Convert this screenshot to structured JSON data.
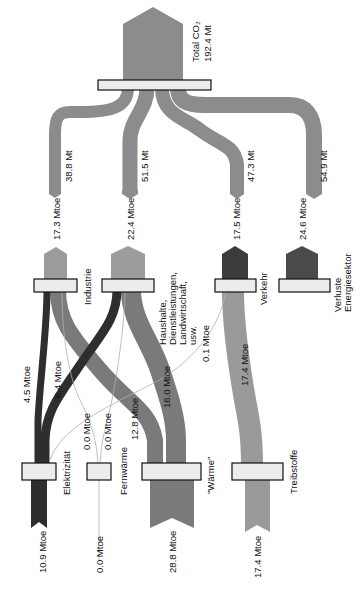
{
  "colors": {
    "co2_flow": "#8c8c8c",
    "sector_flow_light": "#9c9c9c",
    "electricity": "#2e2e2e",
    "heat": "#7a7a7a",
    "fuels": "#9a9a9a",
    "transport_dark": "#3c3c3c",
    "losses_dark": "#4a4a4a",
    "node_fill": "#ececec",
    "node_border": "#111111",
    "thin_line": "#b0b0b0"
  },
  "total": {
    "label": "Total CO₂",
    "value": "192.4 Mt"
  },
  "co2_flows": [
    {
      "id": "industrie",
      "value": "38.8 Mt"
    },
    {
      "id": "haushalte",
      "value": "51.5 Mt"
    },
    {
      "id": "verkehr",
      "value": "47.3 Mt"
    },
    {
      "id": "verluste",
      "value": "54.9 Mt"
    }
  ],
  "sectors": [
    {
      "id": "industrie",
      "label": "Industrie",
      "energy": "17.3 Mtoe"
    },
    {
      "id": "haushalte",
      "label_lines": [
        "Haushalte,",
        "Dienstleistungen,",
        "Landwirtschaft,",
        "usw."
      ],
      "energy": "22.4 Mtoe"
    },
    {
      "id": "verkehr",
      "label": "Verkehr",
      "energy": "17.5 Mtoe"
    },
    {
      "id": "verluste",
      "label_lines": [
        "Verluste",
        "Energiesektor"
      ],
      "energy": "24.6 Mtoe"
    }
  ],
  "cross_flows": [
    {
      "from": "elektrizitaet",
      "to": "industrie",
      "value": "4.5 Mtoe"
    },
    {
      "from": "elektrizitaet",
      "to": "haushalte",
      "value": "6.4 Mtoe"
    },
    {
      "from": "fernwaerme",
      "to": "industrie",
      "value": "0.0 Mtoe"
    },
    {
      "from": "fernwaerme",
      "to": "haushalte",
      "value": "0.0 Mtoe"
    },
    {
      "from": "waerme",
      "to": "industrie",
      "value": "12.8 Mtoe"
    },
    {
      "from": "waerme",
      "to": "haushalte",
      "value": "16.0 Mtoe"
    },
    {
      "from": "waerme",
      "to": "verkehr",
      "value": "0.1 Mtoe"
    },
    {
      "from": "treibstoffe",
      "to": "verkehr",
      "value": "17.4 Mtoe"
    }
  ],
  "carriers": [
    {
      "id": "elektrizitaet",
      "label": "Elektrizität",
      "value": "10.9 Mtoe"
    },
    {
      "id": "fernwaerme",
      "label": "Fernwärme",
      "value": "0.0 Mtoe"
    },
    {
      "id": "waerme",
      "label": "\"Wärme\"",
      "value": "28.8 Mtoe"
    },
    {
      "id": "treibstoffe",
      "label": "Treibstoffe",
      "value": "17.4 Mtoe"
    }
  ]
}
